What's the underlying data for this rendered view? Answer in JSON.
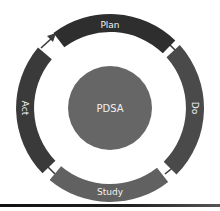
{
  "diagram": {
    "center": {
      "label": "PDSA",
      "color": "#666666"
    },
    "segments": [
      {
        "name": "plan",
        "label": "Plan",
        "color": "#2e2e2e"
      },
      {
        "name": "do",
        "label": "Do",
        "color": "#4a4a4a"
      },
      {
        "name": "study",
        "label": "Study",
        "color": "#616161"
      },
      {
        "name": "act",
        "label": "Act",
        "color": "#3a3a3a"
      }
    ],
    "flow": [
      "Plan",
      "Do",
      "Study",
      "Act",
      "Plan"
    ],
    "arrow": {
      "from": "Act",
      "to": "Plan"
    }
  }
}
